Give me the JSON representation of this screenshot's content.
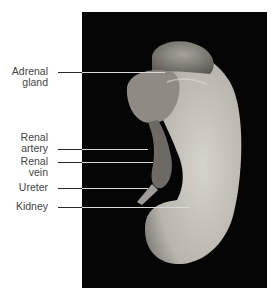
{
  "figure": {
    "title": "",
    "background_color": "#050505",
    "labels": [
      {
        "id": "adrenal-gland",
        "line1": "Adrenal",
        "line2": "gland"
      },
      {
        "id": "renal-artery",
        "line1": "Renal",
        "line2": "artery"
      },
      {
        "id": "renal-vein",
        "line1": "Renal",
        "line2": "vein"
      },
      {
        "id": "ureter",
        "line1": "Ureter",
        "line2": ""
      },
      {
        "id": "kidney",
        "line1": "Kidney",
        "line2": ""
      }
    ]
  }
}
